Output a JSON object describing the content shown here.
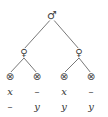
{
  "diagram": {
    "type": "tree",
    "root": {
      "symbol": "♂",
      "x": 52,
      "y": 15
    },
    "internal": [
      {
        "symbol": "♀",
        "x": 24,
        "y": 52
      },
      {
        "symbol": "♀",
        "x": 79,
        "y": 52
      }
    ],
    "leaves": [
      {
        "symbol": "⊗",
        "x": 10,
        "y": 76,
        "row1": "x",
        "row2": "–"
      },
      {
        "symbol": "⊗",
        "x": 37,
        "y": 76,
        "row1": "–",
        "row2": "y"
      },
      {
        "symbol": "⊗",
        "x": 64,
        "y": 76,
        "row1": "x",
        "row2": "y"
      },
      {
        "symbol": "⊗",
        "x": 91,
        "y": 76,
        "row1": "–",
        "row2": "y"
      }
    ],
    "edge_color": "#555555"
  }
}
